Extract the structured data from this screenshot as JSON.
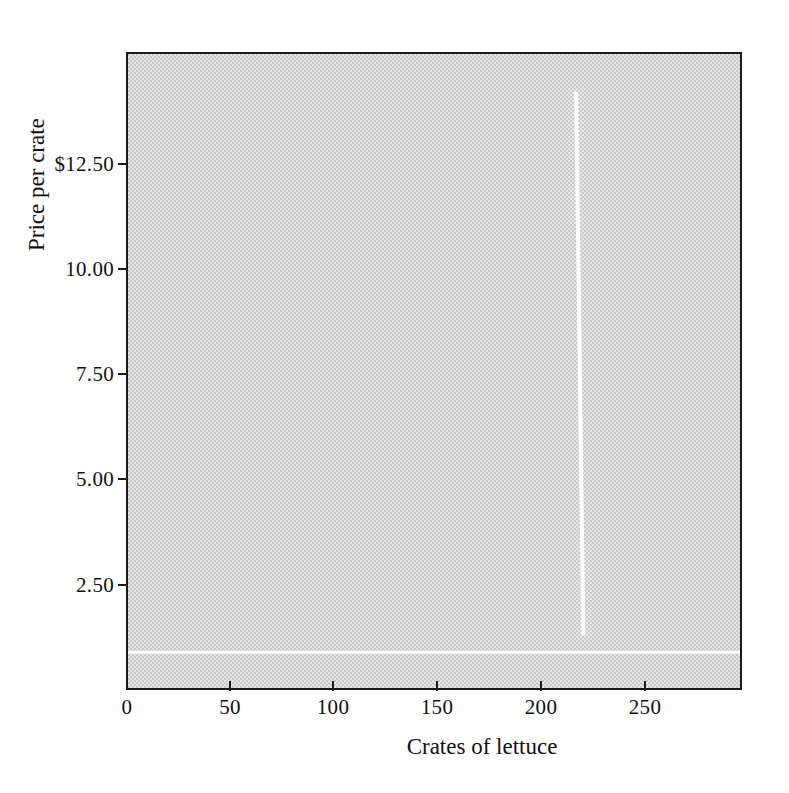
{
  "chart_data": {
    "type": "line",
    "title": "",
    "subtitle": "",
    "xlabel": "Crates of lettuce",
    "ylabel": "Price per crate",
    "xlim": [
      0,
      295
    ],
    "ylim": [
      0,
      15.1
    ],
    "grid": false,
    "legend": null,
    "plot_background": "#c9c9c9",
    "line_color": "#ffffff",
    "axis_color": "#1a1a1a",
    "xticks": [
      {
        "value": 0,
        "label": "0"
      },
      {
        "value": 50,
        "label": "50"
      },
      {
        "value": 100,
        "label": "100"
      },
      {
        "value": 150,
        "label": "150"
      },
      {
        "value": 200,
        "label": "200"
      },
      {
        "value": 250,
        "label": "250"
      }
    ],
    "yticks": [
      {
        "value": 2.5,
        "label": "2.50"
      },
      {
        "value": 5.0,
        "label": "5.00"
      },
      {
        "value": 7.5,
        "label": "7.50"
      },
      {
        "value": 10.0,
        "label": "10.00"
      },
      {
        "value": 12.5,
        "label": "$12.50"
      }
    ],
    "series": [
      {
        "name": "supply",
        "style": "solid-white-vertical",
        "points": [
          {
            "x": 216,
            "y": 14.2
          },
          {
            "x": 219.5,
            "y": 1.25
          }
        ]
      }
    ],
    "annotations": [
      {
        "name": "lower-white-band",
        "type": "horizontal-rule",
        "color": "#ffffff",
        "y": 0.85
      }
    ]
  },
  "axis": {
    "y_title": "Price per crate",
    "x_title": "Crates of lettuce",
    "x_tick_labels": [
      "0",
      "50",
      "100",
      "150",
      "200",
      "250"
    ],
    "y_tick_labels": [
      "2.50",
      "5.00",
      "7.50",
      "10.00",
      "$12.50"
    ]
  }
}
